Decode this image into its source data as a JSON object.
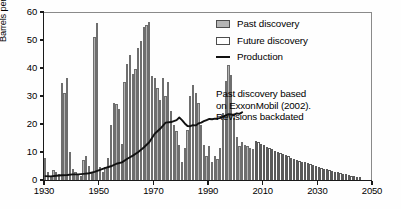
{
  "chart_data": {
    "type": "bar",
    "title": "",
    "xlabel": "",
    "ylabel": "Barrels per Year (in billions)",
    "xlim": [
      1930,
      2050
    ],
    "ylim": [
      0,
      60
    ],
    "xticks": [
      1930,
      1950,
      1970,
      1990,
      2010,
      2030,
      2050
    ],
    "yticks": [
      0,
      10,
      20,
      30,
      40,
      50,
      60
    ],
    "grid": false,
    "legend_position": "top-right",
    "legend": [
      {
        "label": "Past discovery",
        "type": "bar",
        "fill": "#b5b5b5",
        "edge": "#4d4d4d"
      },
      {
        "label": "Future discovery",
        "type": "bar",
        "fill": "#ffffff",
        "edge": "#4d4d4d"
      },
      {
        "label": "Production",
        "type": "line",
        "color": "#111111"
      }
    ],
    "annotations": [
      {
        "text": "Past discovery based",
        "x": 2010,
        "y": 31
      },
      {
        "text": "on ExxonMobil (2002).",
        "x": 2010,
        "y": 27
      },
      {
        "text": "Revisions backdated",
        "x": 2010,
        "y": 23
      }
    ],
    "series": [
      {
        "name": "Past discovery",
        "type": "bar",
        "x": [
          1930,
          1931,
          1932,
          1933,
          1934,
          1935,
          1936,
          1937,
          1938,
          1939,
          1940,
          1941,
          1942,
          1943,
          1944,
          1945,
          1946,
          1947,
          1948,
          1949,
          1950,
          1951,
          1952,
          1953,
          1954,
          1955,
          1956,
          1957,
          1958,
          1959,
          1960,
          1961,
          1962,
          1963,
          1964,
          1965,
          1966,
          1967,
          1968,
          1969,
          1970,
          1971,
          1972,
          1973,
          1974,
          1975,
          1976,
          1977,
          1978,
          1979,
          1980,
          1981,
          1982,
          1983,
          1984,
          1985,
          1986,
          1987,
          1988,
          1989,
          1990,
          1991,
          1992,
          1993,
          1994,
          1995,
          1996,
          1997,
          1998,
          1999,
          2000,
          2001,
          2002,
          2003,
          2004,
          2005,
          2006
        ],
        "values": [
          8.0,
          3.0,
          1.5,
          3.5,
          3.0,
          2.0,
          34.5,
          31.0,
          36.5,
          10.0,
          4.0,
          3.0,
          2.0,
          1.5,
          7.0,
          8.5,
          5.0,
          2.5,
          51.0,
          56.0,
          4.5,
          3.0,
          4.5,
          8.0,
          19.5,
          27.5,
          27.0,
          25.5,
          13.0,
          35.0,
          41.5,
          44.5,
          38.0,
          39.5,
          47.0,
          49.5,
          54.5,
          55.5,
          56.5,
          37.0,
          36.5,
          33.0,
          28.5,
          36.5,
          30.0,
          35.0,
          24.5,
          19.5,
          17.5,
          12.5,
          6.5,
          11.5,
          18.0,
          30.0,
          34.0,
          31.0,
          27.5,
          19.5,
          12.5,
          8.5,
          12.0,
          6.5,
          8.5,
          7.5,
          11.5,
          24.0,
          35.5,
          41.0,
          37.5,
          22.0,
          15.5,
          12.0,
          13.5,
          12.5,
          12.0,
          11.5,
          11.0
        ]
      },
      {
        "name": "Future discovery",
        "type": "bar",
        "x": [
          2007,
          2008,
          2009,
          2010,
          2011,
          2012,
          2013,
          2014,
          2015,
          2016,
          2017,
          2018,
          2019,
          2020,
          2021,
          2022,
          2023,
          2024,
          2025,
          2026,
          2027,
          2028,
          2029,
          2030,
          2031,
          2032,
          2033,
          2034,
          2035,
          2036,
          2037,
          2038,
          2039,
          2040,
          2041,
          2042,
          2043,
          2044,
          2045
        ],
        "values": [
          14.0,
          13.4,
          12.9,
          12.4,
          11.9,
          11.4,
          10.9,
          10.5,
          10.0,
          9.6,
          9.2,
          8.8,
          8.4,
          8.0,
          7.6,
          7.3,
          6.9,
          6.6,
          6.3,
          5.9,
          5.6,
          5.3,
          5.0,
          4.7,
          4.4,
          4.1,
          3.8,
          3.5,
          3.2,
          2.9,
          2.7,
          2.4,
          2.2,
          2.0,
          1.7,
          1.5,
          1.3,
          1.1,
          0.9
        ]
      },
      {
        "name": "Production",
        "type": "line",
        "x": [
          1930,
          1932,
          1934,
          1936,
          1938,
          1940,
          1942,
          1944,
          1946,
          1948,
          1950,
          1952,
          1954,
          1956,
          1958,
          1960,
          1962,
          1964,
          1966,
          1968,
          1970,
          1972,
          1974,
          1976,
          1978,
          1979,
          1980,
          1981,
          1982,
          1983,
          1984,
          1985,
          1986,
          1987,
          1988,
          1989,
          1990,
          1991,
          1992,
          1993,
          1994,
          1995,
          1996,
          1997,
          1998,
          1999,
          2000,
          2001,
          2002
        ],
        "values": [
          1.4,
          1.3,
          1.5,
          1.7,
          1.8,
          2.0,
          2.0,
          2.2,
          2.4,
          2.9,
          3.6,
          4.3,
          4.9,
          5.8,
          6.3,
          7.6,
          8.7,
          10.0,
          11.6,
          13.5,
          16.5,
          18.3,
          20.5,
          20.7,
          21.4,
          22.3,
          21.4,
          20.2,
          19.3,
          19.2,
          19.6,
          19.5,
          20.2,
          20.5,
          21.0,
          21.4,
          21.8,
          21.7,
          21.9,
          21.9,
          22.2,
          22.6,
          23.1,
          23.5,
          23.4,
          23.2,
          23.8,
          23.6,
          24.2
        ]
      }
    ]
  },
  "axis": {
    "y_label": "Barrels per Year (in billions)",
    "y_ticks": [
      "0",
      "10",
      "20",
      "30",
      "40",
      "50",
      "60"
    ],
    "x_ticks": [
      "1930",
      "1950",
      "1970",
      "1990",
      "2010",
      "2030",
      "2050"
    ]
  },
  "legend": {
    "items": [
      {
        "label": "Past discovery"
      },
      {
        "label": "Future discovery"
      },
      {
        "label": "Production"
      }
    ]
  },
  "annotation": {
    "line1": "Past discovery based",
    "line2": "on ExxonMobil (2002).",
    "line3": "Revisions backdated"
  }
}
